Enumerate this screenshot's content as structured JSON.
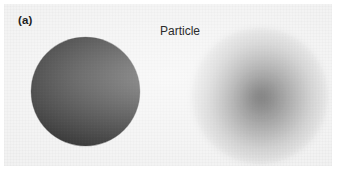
{
  "figure": {
    "panel_label": "(a)",
    "caption": "Particle",
    "background_color": "#f2f2f2",
    "page_color": "#ffffff"
  },
  "chart_data": {
    "type": "diagram",
    "title": "Particle",
    "subtitle": "",
    "panel_label": "(a)",
    "xlabel": "",
    "ylabel": "",
    "grid": false,
    "legend": "none",
    "annotations": [
      "(a)",
      "Particle"
    ],
    "objects": [
      {
        "name": "solid-particle",
        "label": "",
        "shape": "circle",
        "rendering": "sharp-edged solid disc",
        "center_x": 81,
        "center_y": 87,
        "diameter": 109,
        "fill_color": "#1d1d1d",
        "edge": "sharp",
        "opacity": 1.0
      },
      {
        "name": "diffuse-particle",
        "label": "",
        "shape": "circle",
        "rendering": "blurred radial gradient cloud",
        "center_x": 256,
        "center_y": 92,
        "diameter": 136,
        "core_color": "#464646",
        "edge_color": "#f2f2f2",
        "edge": "soft-gradient",
        "opacity": 0.92
      }
    ]
  }
}
